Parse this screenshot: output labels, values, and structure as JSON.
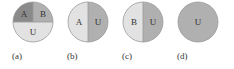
{
  "colors": {
    "dark": "#8a8a8a",
    "mid": "#b0b0b0",
    "light": "#e2e2e2",
    "stroke": "#9a9a9a",
    "text": "#333333"
  },
  "panels": [
    {
      "caption": "(a)",
      "regions": [
        {
          "label": "A"
        },
        {
          "label": "B"
        },
        {
          "label": "U"
        }
      ]
    },
    {
      "caption": "(b)",
      "regions": [
        {
          "label": "A"
        },
        {
          "label": "U"
        }
      ]
    },
    {
      "caption": "(c)",
      "regions": [
        {
          "label": "B"
        },
        {
          "label": "U"
        }
      ]
    },
    {
      "caption": "(d)",
      "regions": [
        {
          "label": "U"
        }
      ]
    }
  ]
}
